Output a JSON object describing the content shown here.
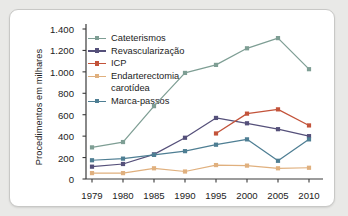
{
  "chart_data": {
    "type": "line",
    "title": "",
    "xlabel": "",
    "ylabel": "Procedimentos em milhares",
    "categories": [
      "1979",
      "1980",
      "1985",
      "1990",
      "1995",
      "2000",
      "2005",
      "2010"
    ],
    "ylim": [
      0,
      1400
    ],
    "ytick_labels": [
      "1.400",
      "1.200",
      "1.000",
      "800",
      "600",
      "400",
      "200",
      "0"
    ],
    "ytick_values": [
      1400,
      1200,
      1000,
      800,
      600,
      400,
      200,
      0
    ],
    "ytick_step": 200,
    "grid": false,
    "legend_position": "upper-left-inside",
    "series": [
      {
        "name": "Cateterismos",
        "color": "#7e9e94",
        "values": [
          295,
          345,
          680,
          990,
          1065,
          1220,
          1315,
          1025
        ]
      },
      {
        "name": "Revascularização",
        "color": "#55507a",
        "values": [
          115,
          140,
          230,
          385,
          570,
          520,
          465,
          400
        ]
      },
      {
        "name": "ICP",
        "color": "#c3533a",
        "values": [
          null,
          null,
          null,
          null,
          425,
          610,
          650,
          500
        ]
      },
      {
        "name": "Endarterectomia carotídea",
        "label_line1": "Endarterectomia",
        "label_line2": "carotídea",
        "color": "#e0b07e",
        "values": [
          55,
          55,
          100,
          70,
          130,
          125,
          100,
          105
        ]
      },
      {
        "name": "Marca-passos",
        "color": "#4e7e93",
        "values": [
          175,
          190,
          225,
          260,
          320,
          370,
          170,
          370
        ]
      }
    ]
  },
  "axis": {
    "line_color": "#3a3a3a"
  }
}
